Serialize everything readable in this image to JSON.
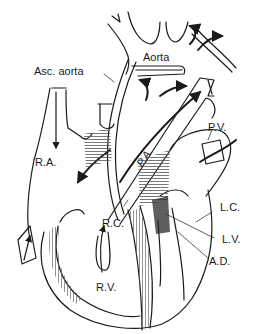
{
  "figure": {
    "colors": {
      "ink": "#1a1a1a",
      "background": "#ffffff",
      "hatch": "#555555"
    }
  },
  "labels": {
    "aorta": "Aorta",
    "asc_aorta": "Asc. aorta",
    "ra": "R.A.",
    "pa": "P.A.",
    "pv": "P.V.",
    "rc": "R.C.",
    "lc": "L.C.",
    "lv": "L.V.",
    "ad": "A.D.",
    "rv": "R.V."
  }
}
